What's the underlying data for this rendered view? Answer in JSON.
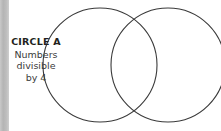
{
  "canvas": {
    "width": 221,
    "height": 131,
    "background_color": "#ffffff"
  },
  "gutter": {
    "name": "left-gray-bar",
    "color": "#bdbdbd",
    "width": 9
  },
  "legend": {
    "title": "CIRCLE A",
    "description_lines": [
      "Numbers",
      "divisible",
      "by 4"
    ],
    "title_color": "#231f20",
    "text_color": "#3b3b3b"
  },
  "diagram": {
    "type": "venn",
    "stroke_color": "#3a3a3a",
    "stroke_width": 1.1,
    "fill": "none",
    "circles": [
      {
        "id": "circle-a",
        "cx": 100,
        "cy": 65,
        "r": 57
      },
      {
        "id": "circle-b",
        "cx": 168,
        "cy": 65,
        "r": 57
      }
    ]
  }
}
